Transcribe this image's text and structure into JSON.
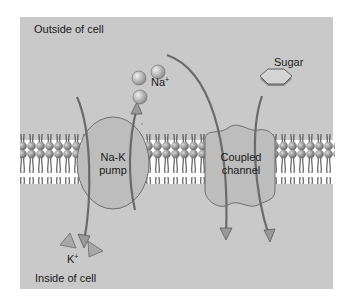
{
  "diagram": {
    "region_labels": {
      "outside": "Outside of cell",
      "inside": "Inside of cell"
    },
    "proteins": {
      "pump": {
        "line1": "Na-K",
        "line2": "pump"
      },
      "channel": {
        "line1": "Coupled",
        "line2": "channel"
      }
    },
    "molecules": {
      "sodium": {
        "symbol": "Na",
        "charge": "+"
      },
      "potassium": {
        "symbol": "K",
        "charge": "+"
      },
      "sugar": "Sugar"
    },
    "colors": {
      "background": "#c9c9c9",
      "protein_fill": "#bdbdbd",
      "outline": "#6e6e6e",
      "head": "#8a8a8a",
      "tail": "#3a3a3a",
      "membrane_core": "#ffffff"
    }
  }
}
